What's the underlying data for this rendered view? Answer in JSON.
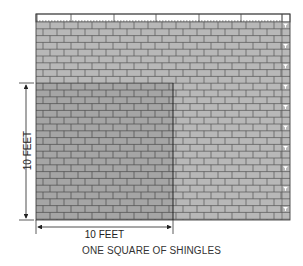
{
  "figure": {
    "caption": "ONE SQUARE OF SHINGLES",
    "dimension_width_label": "10 FEET",
    "dimension_height_label": "10 FEET"
  },
  "colors": {
    "shingle_light": "#b8b8b8",
    "shingle_dark": "#a6a6a6",
    "shingle_lines": "#555555",
    "outline": "#444444",
    "background": "#ffffff"
  },
  "layout": {
    "roof": {
      "x": 36,
      "y": 14,
      "width": 254,
      "height": 206
    },
    "top_strip_dividers_x": [
      37,
      71,
      114,
      156,
      199,
      241,
      282
    ],
    "square": {
      "x": 36,
      "y": 83,
      "width": 137,
      "height": 137
    },
    "row_height": 6.8,
    "brick_width": 14
  }
}
